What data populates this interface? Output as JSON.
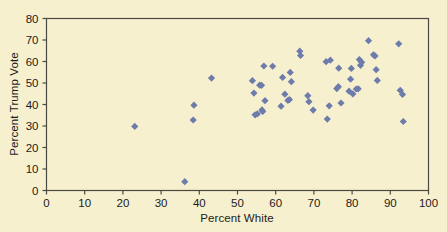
{
  "chart_data": {
    "type": "scatter",
    "title": "",
    "xlabel": "Percent White",
    "ylabel": "Percent Trump Vote",
    "xlim": [
      0,
      100
    ],
    "ylim": [
      0,
      80
    ],
    "xticks": [
      0,
      10,
      20,
      30,
      40,
      50,
      60,
      70,
      80,
      90,
      100
    ],
    "yticks": [
      0,
      10,
      20,
      30,
      40,
      50,
      60,
      70,
      80
    ],
    "grid": false,
    "legend": null,
    "marker": "diamond",
    "marker_color": "#6d7cab",
    "background_color": "#f7f0cf",
    "axis_color": "#4a4a42",
    "points": [
      {
        "x": 23.1,
        "y": 29.8
      },
      {
        "x": 36.2,
        "y": 4.1
      },
      {
        "x": 38.4,
        "y": 32.8
      },
      {
        "x": 38.6,
        "y": 39.7
      },
      {
        "x": 43.2,
        "y": 52.3
      },
      {
        "x": 53.9,
        "y": 51.1
      },
      {
        "x": 54.3,
        "y": 45.3
      },
      {
        "x": 54.6,
        "y": 35.2
      },
      {
        "x": 55.2,
        "y": 35.6
      },
      {
        "x": 55.8,
        "y": 49.0
      },
      {
        "x": 56.3,
        "y": 48.9
      },
      {
        "x": 56.4,
        "y": 37.5
      },
      {
        "x": 56.6,
        "y": 36.8
      },
      {
        "x": 56.9,
        "y": 57.9
      },
      {
        "x": 57.2,
        "y": 41.8
      },
      {
        "x": 59.2,
        "y": 57.8
      },
      {
        "x": 61.4,
        "y": 39.2
      },
      {
        "x": 61.8,
        "y": 52.6
      },
      {
        "x": 62.4,
        "y": 44.8
      },
      {
        "x": 63.2,
        "y": 41.9
      },
      {
        "x": 63.6,
        "y": 42.3
      },
      {
        "x": 63.8,
        "y": 54.9
      },
      {
        "x": 64.1,
        "y": 50.6
      },
      {
        "x": 66.3,
        "y": 64.8
      },
      {
        "x": 66.5,
        "y": 62.8
      },
      {
        "x": 68.4,
        "y": 44.1
      },
      {
        "x": 68.7,
        "y": 41.3
      },
      {
        "x": 69.8,
        "y": 37.4
      },
      {
        "x": 73.2,
        "y": 59.9
      },
      {
        "x": 73.5,
        "y": 33.2
      },
      {
        "x": 74.0,
        "y": 39.4
      },
      {
        "x": 74.3,
        "y": 60.6
      },
      {
        "x": 76.0,
        "y": 47.4
      },
      {
        "x": 76.4,
        "y": 48.3
      },
      {
        "x": 76.5,
        "y": 56.9
      },
      {
        "x": 77.1,
        "y": 40.7
      },
      {
        "x": 79.2,
        "y": 46.2
      },
      {
        "x": 79.6,
        "y": 51.8
      },
      {
        "x": 79.8,
        "y": 56.8
      },
      {
        "x": 80.2,
        "y": 44.9
      },
      {
        "x": 81.1,
        "y": 47.2
      },
      {
        "x": 81.6,
        "y": 47.3
      },
      {
        "x": 81.9,
        "y": 60.9
      },
      {
        "x": 82.2,
        "y": 58.2
      },
      {
        "x": 82.5,
        "y": 59.6
      },
      {
        "x": 84.3,
        "y": 69.7
      },
      {
        "x": 85.6,
        "y": 63.1
      },
      {
        "x": 86.0,
        "y": 62.6
      },
      {
        "x": 86.3,
        "y": 56.2
      },
      {
        "x": 86.6,
        "y": 51.2
      },
      {
        "x": 92.2,
        "y": 68.2
      },
      {
        "x": 92.6,
        "y": 46.6
      },
      {
        "x": 93.2,
        "y": 44.7
      },
      {
        "x": 93.4,
        "y": 32.1
      }
    ]
  }
}
